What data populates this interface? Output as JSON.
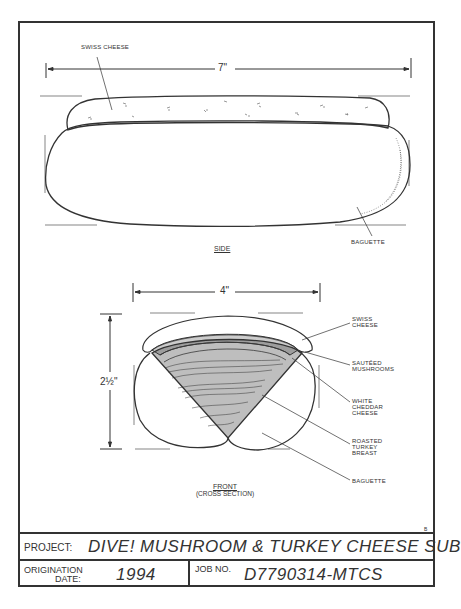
{
  "drawing": {
    "side_view": {
      "dimension": "7\"",
      "label": "SIDE",
      "callouts": [
        "SWISS CHEESE",
        "BAGUETTE"
      ]
    },
    "front_view": {
      "width_dimension": "4\"",
      "height_dimension": "2½\"",
      "label": "FRONT",
      "sublabel": "(CROSS SECTION)",
      "callouts": [
        "SWISS CHEESE",
        "SAUTÉED MUSHROOMS",
        "WHITE CHEDDAR CHEESE",
        "ROASTED TURKEY BREAST",
        "BAGUETTE"
      ]
    },
    "corner_mark": "B"
  },
  "title_block": {
    "project_key": "PROJECT:",
    "project_value": "DIVE! MUSHROOM & TURKEY CHEESE SUB",
    "origination_key_line1": "ORIGINATION",
    "origination_key_line2": "DATE:",
    "origination_value": "1994",
    "job_key": "JOB NO.",
    "job_value": "D7790314-MTCS"
  }
}
